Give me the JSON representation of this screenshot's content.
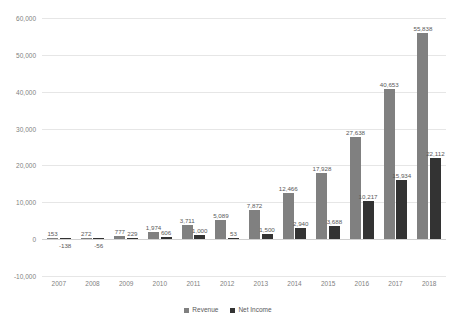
{
  "chart_data": {
    "type": "bar",
    "title": "",
    "subtitle": "",
    "xlabel": "",
    "ylabel": "",
    "categories": [
      "2007",
      "2008",
      "2009",
      "2010",
      "2011",
      "2012",
      "2013",
      "2014",
      "2015",
      "2016",
      "2017",
      "2018"
    ],
    "series": [
      {
        "name": "Revenue",
        "color": "#808080",
        "values": [
          153,
          272,
          777,
          1974,
          3711,
          5089,
          7872,
          12466,
          17928,
          27638,
          40653,
          55838
        ],
        "labels": [
          "153",
          "272",
          "777",
          "1,974",
          "3,711",
          "5,089",
          "7,872",
          "12,466",
          "17,928",
          "27,638",
          "40,653",
          "55,838"
        ]
      },
      {
        "name": "Net Income",
        "color": "#333333",
        "values": [
          -138,
          -56,
          229,
          606,
          1000,
          53,
          1500,
          2940,
          3688,
          10217,
          15934,
          22112
        ],
        "labels": [
          "-138",
          "-56",
          "229",
          "606",
          "1,000",
          "53",
          "1,500",
          "2,940",
          "3,688",
          "10,217",
          "15,934",
          "22,112"
        ]
      }
    ],
    "ylim": [
      -10000,
      60000
    ],
    "yticks": [
      -10000,
      0,
      10000,
      20000,
      30000,
      40000,
      50000,
      60000
    ],
    "ytick_labels": [
      "-10,000",
      "0",
      "10,000",
      "20,000",
      "30,000",
      "40,000",
      "50,000",
      "60,000"
    ],
    "grid": true,
    "legend_position": "bottom",
    "legend_entries": [
      "Revenue",
      "Net Income"
    ]
  }
}
